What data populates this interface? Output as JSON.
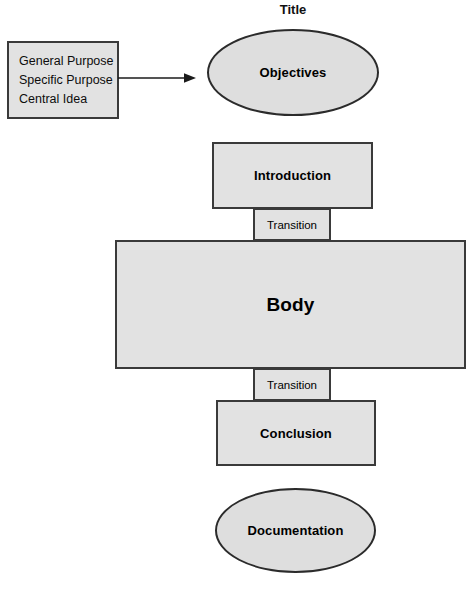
{
  "diagram": {
    "title_caption": "Title",
    "background_color": "#ffffff",
    "shape_fill": "#e2e2e2",
    "ellipse_fill": "#dedede",
    "stroke_color": "#3a3a3a",
    "text_color": "#000000",
    "width": 471,
    "height": 591,
    "purpose_box": {
      "lines": [
        "General Purpose",
        "Specific Purpose",
        "Central Idea"
      ]
    },
    "connector": {
      "type": "arrow",
      "direction": "right",
      "from": "purpose-box",
      "to": "objectives"
    },
    "nodes": [
      {
        "id": "objectives",
        "label": "Objectives",
        "shape": "ellipse"
      },
      {
        "id": "introduction",
        "label": "Introduction",
        "shape": "rectangle"
      },
      {
        "id": "transition-1",
        "label": "Transition",
        "shape": "rectangle"
      },
      {
        "id": "body",
        "label": "Body",
        "shape": "rectangle"
      },
      {
        "id": "transition-2",
        "label": "Transition",
        "shape": "rectangle"
      },
      {
        "id": "conclusion",
        "label": "Conclusion",
        "shape": "rectangle"
      },
      {
        "id": "documentation",
        "label": "Documentation",
        "shape": "ellipse"
      }
    ]
  }
}
